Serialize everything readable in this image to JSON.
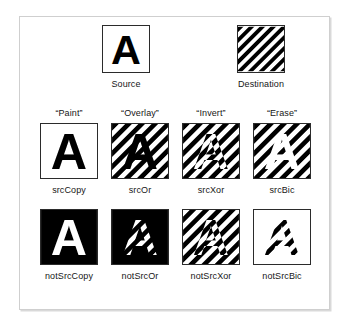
{
  "figure": {
    "colors": {
      "ink": "#000000",
      "paper": "#ffffff",
      "frame": "#cfcfcf",
      "tile_border": "#2b2b2b",
      "text": "#161616"
    },
    "pattern": {
      "name": "diagonal-stripes",
      "angle_degrees": 45,
      "direction": "lower-left to upper-right",
      "stripe_width_px": 5,
      "period_px": 10
    }
  },
  "operands": [
    {
      "id": "source",
      "label": "Source",
      "glyph": "A",
      "fill": "glyph-black-on-white",
      "description": "Black letter A on white background"
    },
    {
      "id": "destination",
      "label": "Destination",
      "glyph": "",
      "fill": "stripes",
      "description": "Full square of 45 degree black diagonal stripes"
    }
  ],
  "results": [
    {
      "row": 1,
      "col": 0,
      "nickname": "“Paint”",
      "mode": "srcCopy",
      "inside_glyph": "black",
      "outside_glyph": "white",
      "description": "Source copied over destination: black A on white"
    },
    {
      "row": 1,
      "col": 1,
      "nickname": "“Overlay”",
      "mode": "srcOr",
      "inside_glyph": "black",
      "outside_glyph": "stripes",
      "description": "Black A painted on top of the striped destination"
    },
    {
      "row": 1,
      "col": 2,
      "nickname": "“Invert”",
      "mode": "srcXor",
      "inside_glyph": "stripes-inverted",
      "outside_glyph": "stripes",
      "description": "Stripes inverted inside the A, unchanged outside"
    },
    {
      "row": 1,
      "col": 3,
      "nickname": "“Erase”",
      "mode": "srcBic",
      "inside_glyph": "white",
      "outside_glyph": "stripes",
      "description": "The A is erased to white, stripes remain outside"
    },
    {
      "row": 2,
      "col": 0,
      "nickname": "",
      "mode": "notSrcCopy",
      "inside_glyph": "white",
      "outside_glyph": "black",
      "description": "Inverted source copied: white A on solid black"
    },
    {
      "row": 2,
      "col": 1,
      "nickname": "",
      "mode": "notSrcOr",
      "inside_glyph": "stripes",
      "outside_glyph": "black",
      "description": "Solid black except stripes showing through the A"
    },
    {
      "row": 2,
      "col": 2,
      "nickname": "",
      "mode": "notSrcXor",
      "inside_glyph": "stripes",
      "outside_glyph": "stripes-inverted",
      "description": "Stripes inverted everywhere outside the A"
    },
    {
      "row": 2,
      "col": 3,
      "nickname": "",
      "mode": "notSrcBic",
      "inside_glyph": "stripes",
      "outside_glyph": "white",
      "description": "Stripes clipped to the A, white elsewhere"
    }
  ]
}
